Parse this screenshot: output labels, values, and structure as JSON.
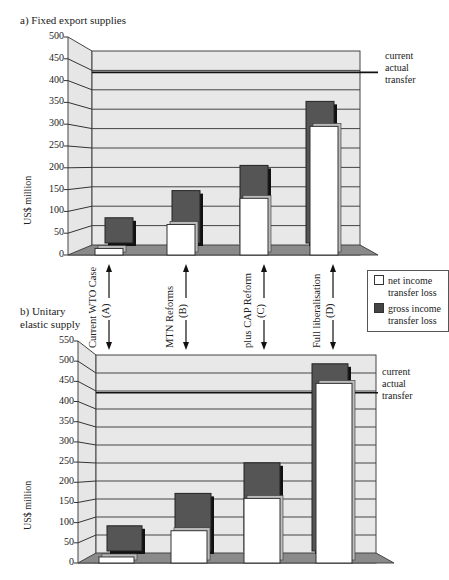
{
  "legend": {
    "net_label_1": "net income",
    "net_label_2": "transfer loss",
    "gross_label_1": "gross income",
    "gross_label_2": "transfer loss",
    "net_color": "#ffffff",
    "gross_color": "#555555"
  },
  "categories": [
    {
      "id": "A",
      "name": "Current WTO Case",
      "code": "(A)"
    },
    {
      "id": "B",
      "name": "MTN Reforms",
      "code": "(B)"
    },
    {
      "id": "C",
      "name": "plus CAP Reform",
      "code": "(C)"
    },
    {
      "id": "D",
      "name": "Full liberalisation",
      "code": "(D)"
    }
  ],
  "chart_a": {
    "title": "a) Fixed export supplies",
    "ylabel": "US$ million",
    "ticks": [
      "500",
      "450",
      "400",
      "350",
      "300",
      "250",
      "200",
      "150",
      "100",
      "50",
      "0"
    ],
    "annotation_1": "current",
    "annotation_2": "actual",
    "annotation_3": "transfer"
  },
  "chart_b": {
    "title_1": "b) Unitary",
    "title_2": "elastic supply",
    "ylabel": "US$ million",
    "ticks": [
      "550",
      "500",
      "450",
      "400",
      "350",
      "300",
      "250",
      "200",
      "150",
      "100",
      "50",
      "0"
    ],
    "annotation_1": "current",
    "annotation_2": "actual",
    "annotation_3": "transfer"
  },
  "chart_data": [
    {
      "type": "bar",
      "title": "a) Fixed export supplies",
      "xlabel": "",
      "ylabel": "US$ million",
      "ylim": [
        0,
        500
      ],
      "categories": [
        "Current WTO Case (A)",
        "MTN Reforms (B)",
        "plus CAP Reform (C)",
        "Full liberalisation (D)"
      ],
      "series": [
        {
          "name": "net income transfer loss",
          "values": [
            15,
            70,
            130,
            295
          ]
        },
        {
          "name": "gross income transfer loss",
          "values": [
            65,
            135,
            200,
            365
          ]
        }
      ],
      "reference_line": {
        "label": "current actual transfer",
        "value": 445
      },
      "grid": true,
      "legend_position": "right"
    },
    {
      "type": "bar",
      "title": "b) Unitary elastic supply",
      "xlabel": "",
      "ylabel": "US$ million",
      "ylim": [
        0,
        550
      ],
      "categories": [
        "Current WTO Case (A)",
        "MTN Reforms (B)",
        "plus CAP Reform (C)",
        "Full liberalisation (D)"
      ],
      "series": [
        {
          "name": "net income transfer loss",
          "values": [
            15,
            80,
            160,
            445
          ]
        },
        {
          "name": "gross income transfer loss",
          "values": [
            70,
            160,
            245,
            520
          ]
        }
      ],
      "reference_line": {
        "label": "current actual transfer",
        "value": 445
      },
      "grid": true,
      "legend_position": "right"
    }
  ]
}
